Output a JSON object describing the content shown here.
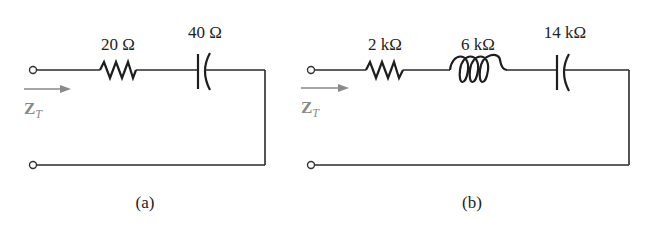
{
  "figure": {
    "panels": [
      {
        "id": "a",
        "caption": "(a)",
        "input_label": "Z",
        "input_label_subscript": "T",
        "components": [
          {
            "type": "resistor",
            "label": "20 Ω"
          },
          {
            "type": "capacitor",
            "label": "40 Ω"
          }
        ]
      },
      {
        "id": "b",
        "caption": "(b)",
        "input_label": "Z",
        "input_label_subscript": "T",
        "components": [
          {
            "type": "resistor",
            "label": "2 kΩ"
          },
          {
            "type": "inductor",
            "label": "6 kΩ"
          },
          {
            "type": "capacitor",
            "label": "14 kΩ"
          }
        ]
      }
    ],
    "colors": {
      "wire": "#2a2a2a",
      "arrow": "#8a8a8a"
    }
  }
}
